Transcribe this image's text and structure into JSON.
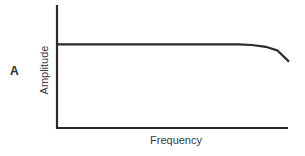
{
  "panel": {
    "label": "A"
  },
  "chart_data": {
    "type": "line",
    "title": "",
    "xlabel": "Frequency",
    "ylabel": "Amplitude",
    "grid": false,
    "legend": null,
    "ticks": false,
    "series": [
      {
        "name": "Amplitude response",
        "x": [
          0,
          0.1,
          0.2,
          0.3,
          0.4,
          0.5,
          0.6,
          0.7,
          0.78,
          0.84,
          0.9,
          0.95,
          1.0
        ],
        "y": [
          0.68,
          0.68,
          0.68,
          0.68,
          0.68,
          0.68,
          0.68,
          0.68,
          0.68,
          0.675,
          0.66,
          0.63,
          0.54
        ]
      }
    ],
    "xlim": [
      0,
      1
    ],
    "ylim": [
      0,
      1
    ]
  },
  "style": {
    "line_color": "#2a2a2a",
    "axis_color": "#2a2a2a"
  }
}
